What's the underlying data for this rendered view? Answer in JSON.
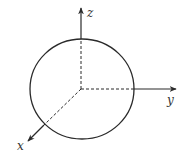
{
  "diagram": {
    "type": "3d-coordinate-axes-with-sphere",
    "colors": {
      "stroke": "#2a2a2a",
      "background": "#ffffff"
    },
    "origin": {
      "x": 81,
      "y": 89
    },
    "sphere": {
      "cx": 82,
      "cy": 89,
      "rx": 52,
      "ry": 50
    },
    "axes": [
      {
        "name": "z",
        "label": "z",
        "direction": "up",
        "hidden_part": "dashed inside sphere"
      },
      {
        "name": "y",
        "label": "y",
        "direction": "right",
        "hidden_part": "dashed inside sphere"
      },
      {
        "name": "x",
        "label": "x",
        "direction": "down-left",
        "hidden_part": "dashed inside sphere"
      }
    ]
  }
}
